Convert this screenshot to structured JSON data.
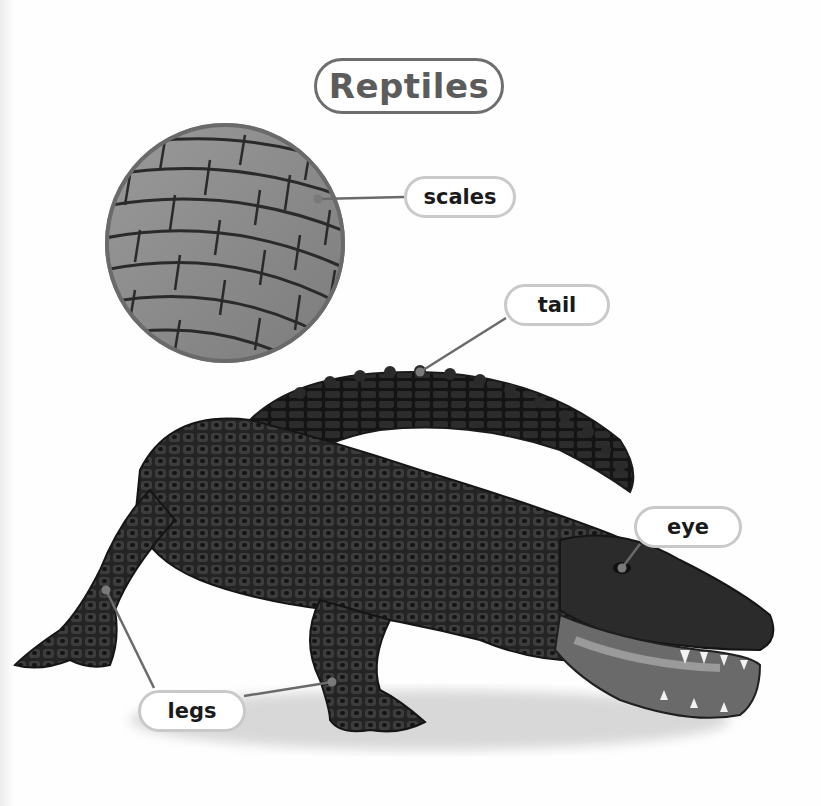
{
  "title": "Reptiles",
  "colors": {
    "title_text": "#5c5c5c",
    "title_border": "#6e6e6e",
    "label_border": "#c9c9c9",
    "label_text": "#1a1a1a",
    "leader_line": "#6a6a6a",
    "marker_dot": "#7a7a7a",
    "inset_ring": "#6a6a6a"
  },
  "inset": {
    "subject": "close-up of alligator scales",
    "center": [
      225,
      243
    ],
    "radius": 120
  },
  "subject": {
    "name": "alligator",
    "description": "alligator photograph, mouth open, tail curled behind body"
  },
  "labels": [
    {
      "id": "scales",
      "text": "scales",
      "box": [
        404,
        176,
        112,
        42
      ],
      "line_to": [
        [
          404,
          197
        ],
        [
          318,
          199
        ]
      ]
    },
    {
      "id": "tail",
      "text": "tail",
      "box": [
        504,
        284,
        106,
        42
      ],
      "line_to": [
        [
          506,
          318
        ],
        [
          420,
          372
        ]
      ]
    },
    {
      "id": "eye",
      "text": "eye",
      "box": [
        634,
        506,
        108,
        42
      ],
      "line_to": [
        [
          640,
          544
        ],
        [
          622,
          568
        ]
      ]
    },
    {
      "id": "legs",
      "text": "legs",
      "box": [
        138,
        690,
        108,
        42
      ],
      "line_to": [
        [
          154,
          688
        ],
        [
          106,
          590
        ]
      ],
      "line_to_2": [
        [
          244,
          696
        ],
        [
          332,
          682
        ]
      ]
    }
  ]
}
